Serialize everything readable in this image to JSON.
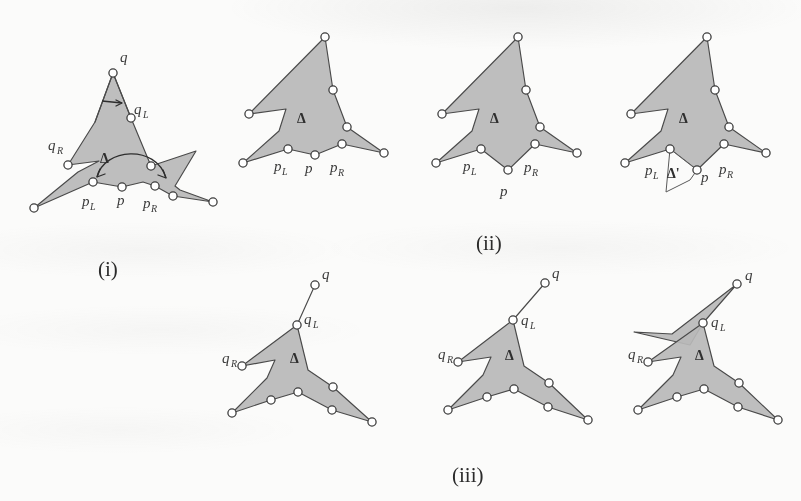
{
  "figure": {
    "background_color": "#fbfbfa",
    "fill_color": "#b9b9b9",
    "stroke_color": "#4a4a4a",
    "vertex_fill": "#ffffff"
  },
  "labels": {
    "p": "p",
    "p_sub_L": "L",
    "p_sub_R": "R",
    "q": "q",
    "q_sub_L": "L",
    "q_sub_R": "R",
    "delta": "Δ",
    "delta_prime": "Δ'"
  },
  "captions": {
    "i": "(i)",
    "ii": "(ii)",
    "iii": "(iii)"
  },
  "panels": [
    {
      "id": "panel-i",
      "caption": "(i)",
      "labels": [
        "q",
        "qL",
        "qR",
        "Δ",
        "pL",
        "p",
        "pR"
      ],
      "annotations": [
        "arc-arrow-over-p",
        "short-arrow-under-q"
      ]
    },
    {
      "id": "panel-ii-1",
      "caption": "",
      "labels": [
        "Δ",
        "pL",
        "p",
        "pR"
      ],
      "annotations": []
    },
    {
      "id": "panel-ii-2",
      "caption": "",
      "labels": [
        "Δ",
        "pL",
        "p",
        "pR"
      ],
      "annotations": [
        "p-pushed-below-chain"
      ]
    },
    {
      "id": "panel-ii-3",
      "caption": "(ii)",
      "labels": [
        "Δ",
        "pL",
        "Δ'",
        "p",
        "pR"
      ],
      "annotations": [
        "notch-delta-prime"
      ]
    },
    {
      "id": "panel-iii-1",
      "caption": "",
      "labels": [
        "q",
        "qL",
        "qR",
        "Δ"
      ],
      "annotations": [
        "q-detached-thin-edge"
      ]
    },
    {
      "id": "panel-iii-2",
      "caption": "",
      "labels": [
        "q",
        "qL",
        "qR",
        "Δ"
      ],
      "annotations": [
        "q-detached-thin-edge"
      ]
    },
    {
      "id": "panel-iii-3",
      "caption": "(iii)",
      "labels": [
        "q",
        "qL",
        "qR",
        "Δ"
      ],
      "annotations": [
        "q-spike-filled"
      ]
    }
  ]
}
